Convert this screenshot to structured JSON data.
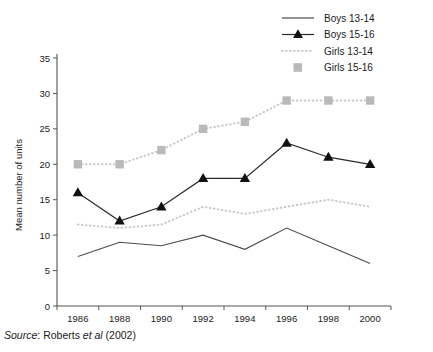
{
  "chart_data": {
    "type": "line",
    "title": "",
    "xlabel": "",
    "ylabel": "Mean number of units",
    "categories": [
      "1986",
      "1988",
      "1990",
      "1992",
      "1994",
      "1996",
      "1998",
      "2000"
    ],
    "x": [
      1986,
      1988,
      1990,
      1992,
      1994,
      1996,
      1998,
      2000
    ],
    "ylim": [
      0,
      35
    ],
    "yticks": [
      0,
      5,
      10,
      15,
      20,
      25,
      30,
      35
    ],
    "grid": false,
    "legend_position": "top-right",
    "series": [
      {
        "name": "Boys 13-14",
        "marker": "none",
        "style": "solid",
        "color": "#4c4c4c",
        "values": [
          7,
          9,
          8.5,
          10,
          8,
          11,
          8.5,
          6
        ]
      },
      {
        "name": "Boys 15-16",
        "marker": "triangle",
        "style": "solid",
        "color": "#2b2b2b",
        "values": [
          16,
          12,
          14,
          18,
          18,
          23,
          21,
          20
        ]
      },
      {
        "name": "Girls 13-14",
        "marker": "none",
        "style": "dotted",
        "color": "#c8c8c8",
        "values": [
          11.5,
          11,
          11.5,
          14,
          13,
          14,
          15,
          14
        ]
      },
      {
        "name": "Girls 15-16",
        "marker": "square",
        "style": "dotted",
        "color": "#b9b9b9",
        "values": [
          20,
          20,
          22,
          25,
          26,
          29,
          29,
          29
        ]
      }
    ]
  },
  "source": {
    "prefix": "Source",
    "separator": ": ",
    "author": "Roberts ",
    "etal": "et al",
    "year": " (2002)"
  },
  "axis": {
    "y_title": "Mean number of units",
    "y_tick_labels": [
      "0",
      "5",
      "10",
      "15",
      "20",
      "25",
      "30",
      "35"
    ],
    "x_tick_labels": [
      "1986",
      "1988",
      "1990",
      "1992",
      "1994",
      "1996",
      "1998",
      "2000"
    ]
  },
  "legend": {
    "items": [
      {
        "label": "Boys 13-14",
        "icon": "line-swatch-icon"
      },
      {
        "label": "Boys 15-16",
        "icon": "line-triangle-swatch-icon"
      },
      {
        "label": "Girls 13-14",
        "icon": "dotted-line-swatch-icon"
      },
      {
        "label": "Girls 15-16",
        "icon": "gray-square-swatch-icon"
      }
    ]
  }
}
